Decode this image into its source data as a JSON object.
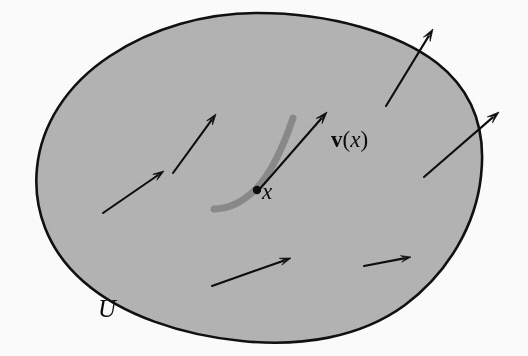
{
  "figure": {
    "type": "vector-field-diagram",
    "caption_labels": {
      "domain": "U",
      "point": "x",
      "vector_field_bold": "v",
      "vector_field_open_paren": "(",
      "vector_field_arg": "x",
      "vector_field_close_paren": ")"
    },
    "colors": {
      "region_fill": "#b4b4b4",
      "region_stroke": "#101010",
      "arrow": "#0d0d0d",
      "integral_curve": "#8a8a8a",
      "point_marker": "#0d0d0d",
      "background": "#fdfdfd"
    },
    "region": {
      "name": "open-set-U",
      "shape": "closed irregular oval blob",
      "bounds": {
        "x_min": 35,
        "y_min": 12,
        "x_max": 482,
        "y_max": 341
      },
      "stroke_width": 2.6,
      "path": "M 258 13 C 330 13 398 33 437 63 C 474 92 486 132 481 176 C 476 224 449 272 405 305 C 360 338 300 347 242 341 C 181 335 122 315 84 282 C 47 250 33 208 37 168 C 41 126 66 85 110 56 C 152 28 205 13 258 13 Z"
    },
    "arrows": [
      {
        "name": "field-arrow-1",
        "x1": 103,
        "y1": 213,
        "x2": 164,
        "y2": 171,
        "head": 11
      },
      {
        "name": "field-arrow-2",
        "x1": 173,
        "y1": 173,
        "x2": 216,
        "y2": 114,
        "head": 11
      },
      {
        "name": "field-arrow-3",
        "x1": 386,
        "y1": 106,
        "x2": 433,
        "y2": 29,
        "head": 12
      },
      {
        "name": "field-arrow-4",
        "x1": 424,
        "y1": 177,
        "x2": 499,
        "y2": 112,
        "head": 12
      },
      {
        "name": "field-arrow-5",
        "x1": 212,
        "y1": 286,
        "x2": 291,
        "y2": 258,
        "head": 11
      },
      {
        "name": "field-arrow-6",
        "x1": 364,
        "y1": 266,
        "x2": 411,
        "y2": 257,
        "head": 10
      },
      {
        "name": "vector-v-at-x",
        "x1": 258,
        "y1": 191,
        "x2": 327,
        "y2": 112,
        "head": 12
      }
    ],
    "integral_curve": {
      "name": "integral-curve-through-x",
      "path": "M 214 209 C 228 209 243 202 256 189 C 272 172 284 145 293 118",
      "stroke_width": 7
    },
    "point_marker": {
      "name": "point-x-marker",
      "cx": 257,
      "cy": 190,
      "r": 4.2
    }
  }
}
